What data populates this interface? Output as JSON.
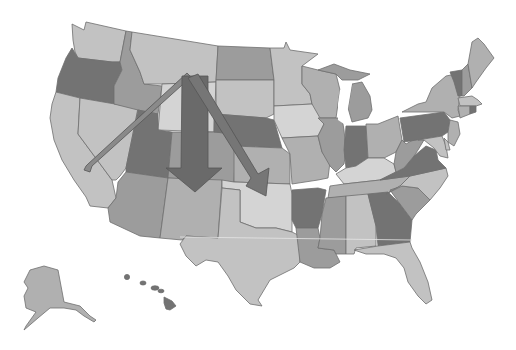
{
  "map": {
    "title": "United States map with migration arrows",
    "background": "#ffffff",
    "palette": {
      "lightest": "#d4d4d4",
      "light": "#c2c2c2",
      "mid_light": "#b0b0b0",
      "mid": "#9c9c9c",
      "mid_dark": "#8a8a8a",
      "dark": "#737373",
      "border": "#6e6e6e"
    },
    "regions": [
      {
        "id": "WA",
        "shade": "light"
      },
      {
        "id": "OR",
        "shade": "dark"
      },
      {
        "id": "CA",
        "shade": "light"
      },
      {
        "id": "ID",
        "shade": "mid"
      },
      {
        "id": "NV",
        "shade": "light"
      },
      {
        "id": "MT",
        "shade": "light"
      },
      {
        "id": "WY",
        "shade": "lightest"
      },
      {
        "id": "UT",
        "shade": "dark"
      },
      {
        "id": "AZ",
        "shade": "mid"
      },
      {
        "id": "CO",
        "shade": "mid"
      },
      {
        "id": "NM",
        "shade": "mid_light"
      },
      {
        "id": "ND",
        "shade": "mid"
      },
      {
        "id": "SD",
        "shade": "light"
      },
      {
        "id": "NE",
        "shade": "dark"
      },
      {
        "id": "KS",
        "shade": "mid_light"
      },
      {
        "id": "OK",
        "shade": "lightest"
      },
      {
        "id": "TX",
        "shade": "light"
      },
      {
        "id": "MN",
        "shade": "light"
      },
      {
        "id": "IA",
        "shade": "lightest"
      },
      {
        "id": "MO",
        "shade": "mid_light"
      },
      {
        "id": "AR",
        "shade": "dark"
      },
      {
        "id": "LA",
        "shade": "mid"
      },
      {
        "id": "WI",
        "shade": "mid_light"
      },
      {
        "id": "IL",
        "shade": "mid"
      },
      {
        "id": "MS",
        "shade": "mid"
      },
      {
        "id": "MI",
        "shade": "mid"
      },
      {
        "id": "IN",
        "shade": "dark"
      },
      {
        "id": "KY",
        "shade": "lightest"
      },
      {
        "id": "TN",
        "shade": "mid_light"
      },
      {
        "id": "AL",
        "shade": "light"
      },
      {
        "id": "OH",
        "shade": "mid_light"
      },
      {
        "id": "GA",
        "shade": "dark"
      },
      {
        "id": "FL",
        "shade": "light"
      },
      {
        "id": "SC",
        "shade": "mid"
      },
      {
        "id": "NC",
        "shade": "light"
      },
      {
        "id": "VA",
        "shade": "dark"
      },
      {
        "id": "WV",
        "shade": "mid"
      },
      {
        "id": "PA",
        "shade": "dark"
      },
      {
        "id": "NY",
        "shade": "mid_light"
      },
      {
        "id": "VT",
        "shade": "dark"
      },
      {
        "id": "NH",
        "shade": "mid"
      },
      {
        "id": "ME",
        "shade": "mid_light"
      },
      {
        "id": "MA",
        "shade": "light"
      },
      {
        "id": "CT",
        "shade": "mid_light"
      },
      {
        "id": "RI",
        "shade": "dark"
      },
      {
        "id": "NJ",
        "shade": "mid_light"
      },
      {
        "id": "DE",
        "shade": "light"
      },
      {
        "id": "MD",
        "shade": "light"
      },
      {
        "id": "AK",
        "shade": "mid_light"
      },
      {
        "id": "HI",
        "shade": "dark"
      }
    ],
    "arrows": [
      {
        "id": "arrow-to-california",
        "from": "MT/WY",
        "to": "CA/NV",
        "style": "thin",
        "fill": "#8a8a8a"
      },
      {
        "id": "arrow-to-new-mexico",
        "from": "MT/WY",
        "to": "CO/NM",
        "style": "wide",
        "fill": "#6a6a6a"
      },
      {
        "id": "arrow-to-oklahoma",
        "from": "MT/WY",
        "to": "KS/OK",
        "style": "medium",
        "fill": "#767676"
      }
    ]
  }
}
